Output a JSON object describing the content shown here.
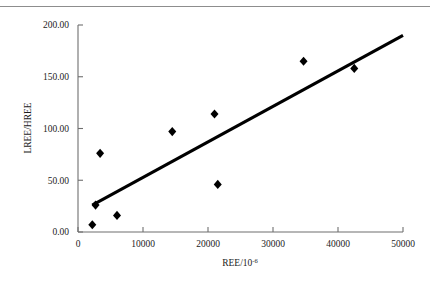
{
  "chart_data": {
    "type": "scatter",
    "title": "",
    "xlabel": "REE/10−6",
    "ylabel": "LREE/HREE",
    "xlabel_base": "REE/10",
    "xlabel_exponent": "-6",
    "xlim": [
      0,
      50000
    ],
    "ylim": [
      0,
      200
    ],
    "grid": false,
    "legend": "none",
    "xticks": [
      0,
      10000,
      20000,
      30000,
      40000,
      50000
    ],
    "xtick_labels": [
      "0",
      "10000",
      "20000",
      "30000",
      "40000",
      "50000"
    ],
    "yticks": [
      0,
      50,
      100,
      150,
      200
    ],
    "ytick_labels": [
      "0.00",
      "50.00",
      "100.00",
      "150.00",
      "200.00"
    ],
    "marker": "filled-diamond",
    "marker_color": "#000000",
    "series": [
      {
        "name": "samples",
        "points": [
          {
            "x": 2200,
            "y": 7
          },
          {
            "x": 2700,
            "y": 26
          },
          {
            "x": 3400,
            "y": 76
          },
          {
            "x": 6000,
            "y": 16
          },
          {
            "x": 14500,
            "y": 97
          },
          {
            "x": 21000,
            "y": 114
          },
          {
            "x": 21500,
            "y": 46
          },
          {
            "x": 34700,
            "y": 165
          },
          {
            "x": 42500,
            "y": 158
          }
        ]
      }
    ],
    "trendline": {
      "type": "linear",
      "color": "#000000",
      "x_start": 2200,
      "y_start": 26,
      "x_end": 50000,
      "y_end": 190
    }
  },
  "figure": {
    "page_rule_color": "#8d8d8d",
    "axis_color": "#6f6f6f",
    "background": "#ffffff"
  }
}
